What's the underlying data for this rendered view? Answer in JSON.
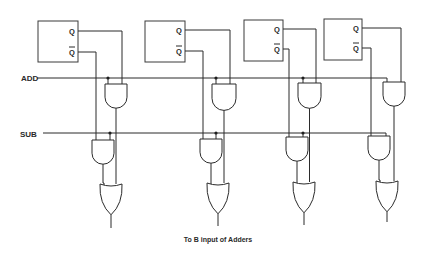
{
  "diagram": {
    "type": "logic-circuit",
    "control_lines": [
      {
        "id": "add",
        "label": "ADD",
        "gates": "Q"
      },
      {
        "id": "sub",
        "label": "SUB",
        "gates": "Q-bar"
      }
    ],
    "stages": [
      {
        "index": 0,
        "q_label": "Q",
        "qbar_label": "Q"
      },
      {
        "index": 1,
        "q_label": "Q",
        "qbar_label": "Q"
      },
      {
        "index": 2,
        "q_label": "Q",
        "qbar_label": "Q"
      },
      {
        "index": 3,
        "q_label": "Q",
        "qbar_label": "Q"
      }
    ],
    "caption": "To B input of Adders"
  },
  "labels": {
    "add": "ADD",
    "sub": "SUB",
    "q": "Q",
    "qbar": "Q",
    "caption": "To B input of Adders"
  }
}
